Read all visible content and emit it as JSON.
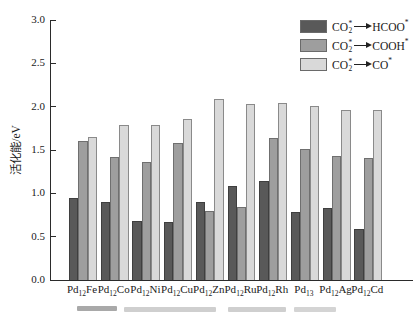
{
  "colors": {
    "dark": "#595959",
    "medium": "#9e9e9e",
    "light": "#d9d9d9",
    "dark_border": "#3f3f3f",
    "medium_border": "#6f6f6f",
    "light_border": "#8a8a8a",
    "axis": "#2b2b2b"
  },
  "chart_data": {
    "type": "bar",
    "title": "",
    "xlabel": "",
    "ylabel": "活化能/eV",
    "ylim": [
      0,
      3.0
    ],
    "ytick_step": 0.5,
    "grid": false,
    "legend_position": "top-right",
    "yticks": [
      {
        "value": 0.0,
        "label": "0.0"
      },
      {
        "value": 0.5,
        "label": "0.5"
      },
      {
        "value": 1.0,
        "label": "1.0"
      },
      {
        "value": 1.5,
        "label": "1.5"
      },
      {
        "value": 2.0,
        "label": "2.0"
      },
      {
        "value": 2.5,
        "label": "2.5"
      },
      {
        "value": 3.0,
        "label": "3.0"
      }
    ],
    "categories": [
      {
        "base": "Pd",
        "sub": "12",
        "element": "Fe"
      },
      {
        "base": "Pd",
        "sub": "12",
        "element": "Co"
      },
      {
        "base": "Pd",
        "sub": "12",
        "element": "Ni"
      },
      {
        "base": "Pd",
        "sub": "12",
        "element": "Cu"
      },
      {
        "base": "Pd",
        "sub": "12",
        "element": "Zn"
      },
      {
        "base": "Pd",
        "sub": "12",
        "element": "Ru"
      },
      {
        "base": "Pd",
        "sub": "12",
        "element": "Rh"
      },
      {
        "base": "Pd",
        "sub": "13",
        "element": ""
      },
      {
        "base": "Pd",
        "sub": "12",
        "element": "Ag"
      },
      {
        "base": "Pd",
        "sub": "12",
        "element": "Cd"
      }
    ],
    "series": [
      {
        "name": "CO2* -> HCOO*",
        "color_key": "dark",
        "values": [
          0.95,
          0.9,
          0.68,
          0.67,
          0.9,
          1.08,
          1.14,
          0.78,
          0.83,
          0.59
        ]
      },
      {
        "name": "CO2* -> COOH*",
        "color_key": "medium",
        "values": [
          1.6,
          1.42,
          1.36,
          1.58,
          0.8,
          0.84,
          1.64,
          1.51,
          1.43,
          1.41
        ]
      },
      {
        "name": "CO2* -> CO*",
        "color_key": "light",
        "values": [
          1.65,
          1.79,
          1.79,
          1.86,
          2.09,
          2.03,
          2.04,
          2.01,
          1.96,
          1.96
        ]
      }
    ],
    "legend": [
      {
        "swatch": "dark",
        "reactant_base": "CO",
        "reactant_sup": "*",
        "reactant_sub": "2",
        "product_base": "HCOO",
        "product_sup": "*"
      },
      {
        "swatch": "medium",
        "reactant_base": "CO",
        "reactant_sup": "*",
        "reactant_sub": "2",
        "product_base": "COOH",
        "product_sup": "*"
      },
      {
        "swatch": "light",
        "reactant_base": "CO",
        "reactant_sup": "*",
        "reactant_sub": "2",
        "product_base": "CO",
        "product_sup": "*"
      }
    ]
  }
}
